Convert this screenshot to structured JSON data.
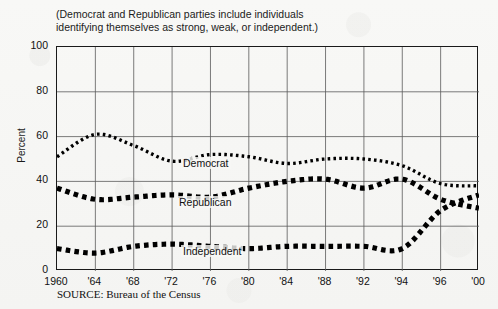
{
  "chart_data": {
    "type": "line",
    "title": "(Democrat and Republican parties include individuals\nidentifying themselves as strong, weak, or independent.)",
    "xlabel": "",
    "ylabel": "Percent",
    "ylim": [
      0,
      100
    ],
    "yticks": [
      0,
      20,
      40,
      60,
      80,
      100
    ],
    "grid": true,
    "legend_position": "inline-labels",
    "source": "SOURCE: Bureau of the Census",
    "categories": [
      "1960",
      "'64",
      "'68",
      "'72",
      "'76",
      "'80",
      "'84",
      "'88",
      "'92",
      "'94",
      "'96",
      "'00"
    ],
    "x": [
      1960,
      1964,
      1968,
      1972,
      1976,
      1980,
      1984,
      1988,
      1992,
      1994,
      1996,
      2000
    ],
    "series": [
      {
        "name": "Democrat",
        "values": [
          51,
          61,
          56,
          49,
          52,
          51,
          48,
          50,
          50,
          47,
          39,
          38
        ]
      },
      {
        "name": "Republican",
        "values": [
          37,
          32,
          33,
          34,
          33,
          37,
          40,
          41,
          37,
          41,
          32,
          28
        ]
      },
      {
        "name": "Independent",
        "values": [
          10,
          8,
          11,
          12,
          11,
          10,
          11,
          11,
          11,
          10,
          27,
          34
        ]
      }
    ]
  },
  "labels": {
    "democrat": "Democrat",
    "republican": "Republican",
    "independent": "Independent"
  }
}
